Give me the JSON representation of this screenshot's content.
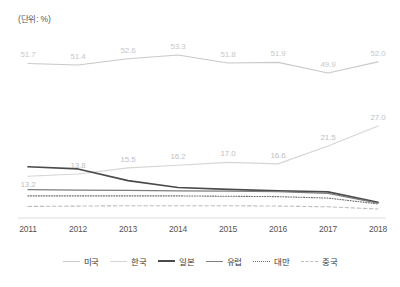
{
  "unit_label": "(단위: %)",
  "legend": {
    "items": [
      {
        "label": "미국",
        "color": "#c9c9c9",
        "style": "solid"
      },
      {
        "label": "한국",
        "color": "#d5d5d5",
        "style": "solid"
      },
      {
        "label": "일본",
        "color": "#4a4a4a",
        "style": "solid"
      },
      {
        "label": "유럽",
        "color": "#7d7d7d",
        "style": "solid"
      },
      {
        "label": "대만",
        "color": "#6f6f6f",
        "style": "dotted"
      },
      {
        "label": "중국",
        "color": "#bdbdbd",
        "style": "dashed"
      }
    ]
  },
  "chart_data": {
    "type": "line",
    "title": "",
    "xlabel": "",
    "ylabel": "",
    "unit": "%",
    "grid": false,
    "legend_position": "bottom",
    "categories": [
      "2011",
      "2012",
      "2013",
      "2014",
      "2015",
      "2016",
      "2017",
      "2018"
    ],
    "series": [
      {
        "name": "미국",
        "color": "#c9c9c9",
        "style": "solid",
        "labelled": true,
        "values": [
          51.7,
          51.4,
          52.6,
          53.3,
          51.8,
          51.9,
          49.9,
          52.0
        ]
      },
      {
        "name": "한국",
        "color": "#d5d5d5",
        "style": "solid",
        "labelled": true,
        "values": [
          13.2,
          13.8,
          15.5,
          16.2,
          17.0,
          16.6,
          21.5,
          27.0
        ]
      },
      {
        "name": "일본",
        "color": "#4a4a4a",
        "style": "solid",
        "labelled": false,
        "values": [
          15.8,
          15.2,
          12.0,
          10.1,
          9.6,
          9.2,
          8.9,
          6.0
        ]
      },
      {
        "name": "유럽",
        "color": "#7d7d7d",
        "style": "solid",
        "labelled": false,
        "values": [
          9.5,
          9.4,
          9.3,
          9.2,
          9.1,
          9.0,
          8.5,
          5.8
        ]
      },
      {
        "name": "대만",
        "color": "#6f6f6f",
        "style": "dotted",
        "labelled": false,
        "values": [
          7.8,
          7.8,
          7.8,
          7.8,
          7.7,
          7.6,
          7.2,
          5.6
        ]
      },
      {
        "name": "중국",
        "color": "#bdbdbd",
        "style": "dashed",
        "labelled": false,
        "values": [
          4.9,
          5.0,
          5.1,
          5.1,
          5.1,
          5.0,
          4.8,
          4.2
        ]
      }
    ],
    "data_labels": {
      "미국": [
        "51.7",
        "51.4",
        "52.6",
        "53.3",
        "51.8",
        "51.9",
        "49.9",
        "52.0"
      ],
      "한국": [
        "13.2",
        "13.8",
        "15.5",
        "16.2",
        "17.0",
        "16.6",
        "21.5",
        "27.0"
      ]
    }
  }
}
